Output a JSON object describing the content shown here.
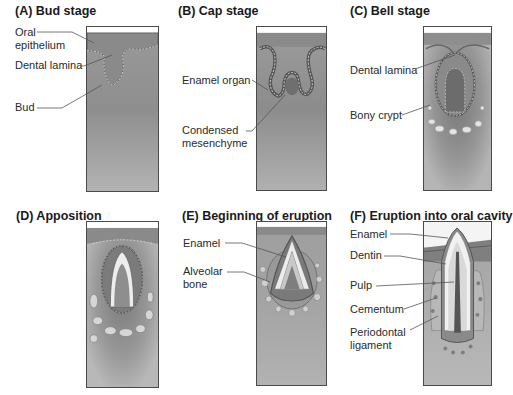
{
  "figure": {
    "panels": [
      {
        "id": "A",
        "title": "(A) Bud stage",
        "labels": [
          "Oral\nepithelium",
          "Dental lamina",
          "Bud"
        ]
      },
      {
        "id": "B",
        "title": "(B) Cap stage",
        "labels": [
          "Enamel organ",
          "Condensed\nmesenchyme"
        ]
      },
      {
        "id": "C",
        "title": "(C) Bell stage",
        "labels": [
          "Dental lamina",
          "Bony crypt"
        ]
      },
      {
        "id": "D",
        "title": "(D) Apposition",
        "labels": []
      },
      {
        "id": "E",
        "title": "(E) Beginning of eruption",
        "labels": [
          "Enamel",
          "Alveolar\nbone"
        ]
      },
      {
        "id": "F",
        "title": "(F) Eruption into oral cavity",
        "labels": [
          "Enamel",
          "Dentin",
          "Pulp",
          "Cementum",
          "Periodontal\nligament"
        ]
      }
    ]
  },
  "colors": {
    "tissue": "#a3a3a3",
    "tissue_dark": "#7d7d7d",
    "epithelium": "#8f8f8f",
    "enamel": "#e9e9e9",
    "bone": "#d4d4d4",
    "border": "#4a4a4a"
  }
}
